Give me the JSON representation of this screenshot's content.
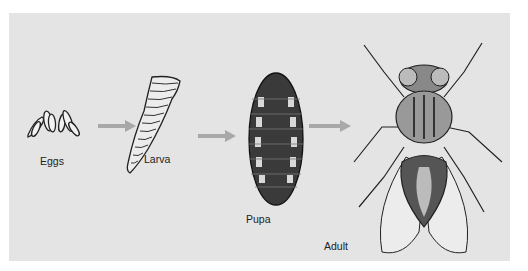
{
  "figure": {
    "page_number": "185",
    "stages": [
      {
        "id": "eggs",
        "label": "Eggs"
      },
      {
        "id": "larva",
        "label": "Larva"
      },
      {
        "id": "pupa",
        "label": "Pupa"
      },
      {
        "id": "adult",
        "label": "Adult"
      }
    ],
    "arrow_color": "#a8a8a8",
    "panel_color": "#e4e4e4"
  }
}
